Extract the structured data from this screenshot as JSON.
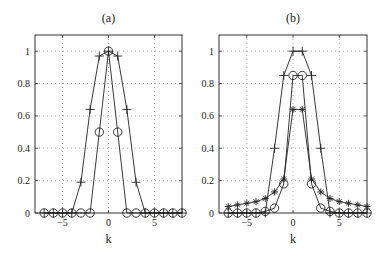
{
  "chart_data": [
    {
      "type": "line",
      "title": "(a)",
      "xlabel": "k",
      "ylabel": "",
      "xlim": [
        -8,
        8
      ],
      "ylim": [
        0,
        1.1
      ],
      "xticks": [
        -5,
        0,
        5
      ],
      "xtick_labels": [
        "−5",
        "0",
        "5"
      ],
      "yticks": [
        0,
        0.2,
        0.4,
        0.6,
        0.8,
        1
      ],
      "ytick_labels": [
        "0",
        "0.2",
        "0.4",
        "0.6",
        "0.8",
        "1"
      ],
      "grid": true,
      "x": [
        -7,
        -6,
        -5,
        -4,
        -3,
        -2,
        -1,
        0,
        1,
        2,
        3,
        4,
        5,
        6,
        7,
        8
      ],
      "series": [
        {
          "name": "plus",
          "marker": "+",
          "values": [
            0,
            0,
            0,
            0,
            0.19,
            0.64,
            0.97,
            1,
            0.97,
            0.64,
            0.19,
            0,
            0,
            0,
            0,
            0
          ]
        },
        {
          "name": "circle",
          "marker": "o",
          "values": [
            0,
            0,
            0,
            0,
            0,
            0,
            0.5,
            1,
            0.5,
            0,
            0,
            0,
            0,
            0,
            0,
            0
          ]
        }
      ]
    },
    {
      "type": "line",
      "title": "(b)",
      "xlabel": "k",
      "ylabel": "",
      "xlim": [
        -8,
        8
      ],
      "ylim": [
        0,
        1.1
      ],
      "xticks": [
        -5,
        0,
        5
      ],
      "xtick_labels": [
        "−5",
        "0",
        "5"
      ],
      "yticks": [
        0,
        0.2,
        0.4,
        0.6,
        0.8,
        1
      ],
      "ytick_labels": [
        "0",
        "0.2",
        "0.4",
        "0.6",
        "0.8",
        "1"
      ],
      "grid": true,
      "x": [
        -7,
        -6,
        -5,
        -4,
        -3,
        -2,
        -1,
        0,
        1,
        2,
        3,
        4,
        5,
        6,
        7,
        8
      ],
      "series": [
        {
          "name": "plus",
          "marker": "+",
          "values": [
            0,
            0,
            0,
            0,
            0,
            0.4,
            0.85,
            1,
            1,
            0.85,
            0.4,
            0,
            0,
            0,
            0,
            0
          ]
        },
        {
          "name": "circle",
          "marker": "o",
          "values": [
            0,
            0,
            0,
            0,
            0.01,
            0.03,
            0.18,
            0.85,
            0.85,
            0.18,
            0.03,
            0.01,
            0,
            0,
            0,
            0
          ]
        },
        {
          "name": "star",
          "marker": "*",
          "values": [
            0.04,
            0.05,
            0.06,
            0.07,
            0.09,
            0.13,
            0.21,
            0.64,
            0.64,
            0.21,
            0.13,
            0.09,
            0.07,
            0.06,
            0.05,
            0.04
          ]
        }
      ]
    }
  ]
}
